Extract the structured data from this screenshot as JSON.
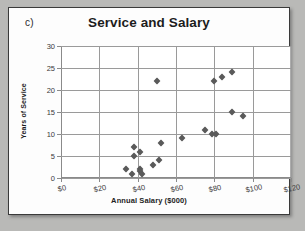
{
  "panel": {
    "label": "c)"
  },
  "chart_data": {
    "type": "scatter",
    "title": "Service and Salary",
    "xlabel": "Annual Salary ($000)",
    "ylabel": "Years of Service",
    "xlim": [
      0,
      120
    ],
    "ylim": [
      0,
      30
    ],
    "xticks": [
      0,
      20,
      40,
      60,
      80,
      100,
      120
    ],
    "yticks": [
      0,
      5,
      10,
      15,
      20,
      25,
      30
    ],
    "xticklabels": [
      "$0",
      "$20",
      "$40",
      "$60",
      "$80",
      "$100",
      "$120"
    ],
    "yticklabels": [
      "0",
      "5",
      "10",
      "15",
      "20",
      "25",
      "30"
    ],
    "grid": "both",
    "legend": "none",
    "marker": "diamond",
    "marker_color": "#5a5a5a",
    "points": [
      {
        "x": 34,
        "y": 2
      },
      {
        "x": 37,
        "y": 1
      },
      {
        "x": 38,
        "y": 5
      },
      {
        "x": 38,
        "y": 7
      },
      {
        "x": 41,
        "y": 6
      },
      {
        "x": 41,
        "y": 2
      },
      {
        "x": 41,
        "y": 1.5
      },
      {
        "x": 42,
        "y": 1
      },
      {
        "x": 48,
        "y": 3
      },
      {
        "x": 50,
        "y": 22
      },
      {
        "x": 51,
        "y": 4
      },
      {
        "x": 52,
        "y": 8
      },
      {
        "x": 63,
        "y": 9
      },
      {
        "x": 75,
        "y": 11
      },
      {
        "x": 79,
        "y": 10
      },
      {
        "x": 81,
        "y": 10
      },
      {
        "x": 80,
        "y": 22
      },
      {
        "x": 84,
        "y": 23
      },
      {
        "x": 89,
        "y": 24
      },
      {
        "x": 89,
        "y": 15
      },
      {
        "x": 95,
        "y": 14
      }
    ]
  }
}
